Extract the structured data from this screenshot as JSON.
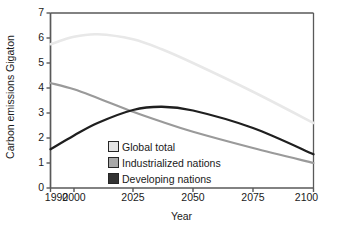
{
  "chart_data": {
    "type": "line",
    "title": "",
    "xlabel": "Year",
    "ylabel": "Carbon emissions Gigaton",
    "xlim": [
      1990,
      2100
    ],
    "ylim": [
      0,
      7
    ],
    "xticks": [
      "1990",
      "2000",
      "2025",
      "2050",
      "2075",
      "2100"
    ],
    "xtick_values": [
      1990,
      2000,
      2025,
      2050,
      2075,
      2100
    ],
    "yticks": [
      "0",
      "1",
      "2",
      "3",
      "4",
      "5",
      "6",
      "7"
    ],
    "ytick_values": [
      0,
      1,
      2,
      3,
      4,
      5,
      6,
      7
    ],
    "grid": false,
    "legend_position": "inside lower-left",
    "x": [
      1990,
      2000,
      2010,
      2025,
      2037,
      2050,
      2075,
      2100
    ],
    "series": [
      {
        "name": "Global total",
        "color": "#e8e8e8",
        "values": [
          5.75,
          6.05,
          6.15,
          5.95,
          5.55,
          5.0,
          3.85,
          2.6
        ]
      },
      {
        "name": "Industrialized nations",
        "color": "#9a9a9a",
        "values": [
          4.2,
          3.95,
          3.6,
          3.05,
          2.65,
          2.25,
          1.6,
          1.0
        ]
      },
      {
        "name": "Developing nations",
        "color": "#1f1f1f",
        "values": [
          1.55,
          2.1,
          2.6,
          3.12,
          3.25,
          3.1,
          2.4,
          1.35
        ]
      }
    ]
  },
  "axes": {
    "ylabel": "Carbon emissions Gigaton",
    "xlabel": "Year",
    "frame_color": "#595959"
  },
  "legend": {
    "items": [
      {
        "label": "Global total",
        "swatch": "#e4e4e4"
      },
      {
        "label": "Industrialized nations",
        "swatch": "#a8a8a8"
      },
      {
        "label": "Developing nations",
        "swatch": "#333333"
      }
    ]
  }
}
